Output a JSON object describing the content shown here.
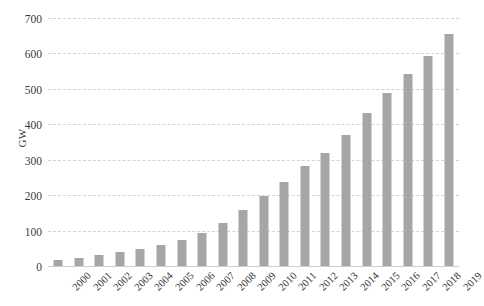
{
  "chart_data": {
    "type": "bar",
    "title": "",
    "subtitle": "",
    "xlabel": "",
    "ylabel": "GW",
    "ylim": [
      0,
      700
    ],
    "ytick_values": [
      0,
      100,
      200,
      300,
      400,
      500,
      600,
      700
    ],
    "ytick_labels": [
      "0",
      "100",
      "200",
      "300",
      "400",
      "500",
      "600",
      "700"
    ],
    "grid": true,
    "legend": null,
    "bar_color": "#a6a6a6",
    "gridline_color": "#d4d4d4",
    "axis_color": "#cfcfcf",
    "categories": [
      "2000",
      "2001",
      "2002",
      "2003",
      "2004",
      "2005",
      "2006",
      "2007",
      "2008",
      "2009",
      "2010",
      "2011",
      "2012",
      "2013",
      "2014",
      "2015",
      "2016",
      "2017",
      "2018",
      "2019"
    ],
    "values": [
      17,
      24,
      31,
      40,
      48,
      59,
      74,
      94,
      121,
      159,
      198,
      238,
      283,
      319,
      370,
      433,
      488,
      541,
      594,
      656
    ]
  }
}
